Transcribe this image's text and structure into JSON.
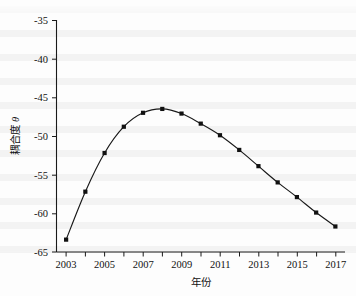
{
  "chart_data": {
    "type": "line",
    "title": "",
    "subtitle": "",
    "xlabel": "年份",
    "ylabel": "耦合度 θ",
    "ylabel_text": "耦合度",
    "ylabel_symbol": "θ",
    "x": [
      2003,
      2004,
      2005,
      2006,
      2007,
      2008,
      2009,
      2010,
      2011,
      2012,
      2013,
      2014,
      2015,
      2016,
      2017
    ],
    "values": [
      -63.4,
      -57.2,
      -52.2,
      -48.8,
      -47.0,
      -46.5,
      -47.1,
      -48.4,
      -49.9,
      -51.8,
      -53.9,
      -56.0,
      -57.9,
      -59.9,
      -61.7
    ],
    "categories": [
      "2003",
      "2004",
      "2005",
      "2006",
      "2007",
      "2008",
      "2009",
      "2010",
      "2011",
      "2012",
      "2013",
      "2014",
      "2015",
      "2016",
      "2017"
    ],
    "series": [
      {
        "name": "耦合度 θ",
        "values": [
          -63.4,
          -57.2,
          -52.2,
          -48.8,
          -47.0,
          -46.5,
          -47.1,
          -48.4,
          -49.9,
          -51.8,
          -53.9,
          -56.0,
          -57.9,
          -59.9,
          -61.7
        ]
      }
    ],
    "xlim": [
      2002.5,
      2017.5
    ],
    "ylim": [
      -65,
      -35
    ],
    "xticks_major": [
      "2003",
      "2005",
      "2007",
      "2009",
      "2011",
      "2013",
      "2015",
      "2017"
    ],
    "xticks_major_values": [
      2003,
      2005,
      2007,
      2009,
      2011,
      2013,
      2015,
      2017
    ],
    "xticks_minor_values": [
      2004,
      2006,
      2008,
      2010,
      2012,
      2014,
      2016
    ],
    "yticks": [
      "-35",
      "-40",
      "-45",
      "-50",
      "-55",
      "-60",
      "-65"
    ],
    "yticks_values": [
      -35,
      -40,
      -45,
      -50,
      -55,
      -60,
      -65
    ],
    "grid": false,
    "legend": false,
    "legend_position": "none",
    "marker": "square",
    "line_color": "#181818",
    "marker_color": "#111111",
    "background_color": "#fdfdfd",
    "annotations": []
  }
}
